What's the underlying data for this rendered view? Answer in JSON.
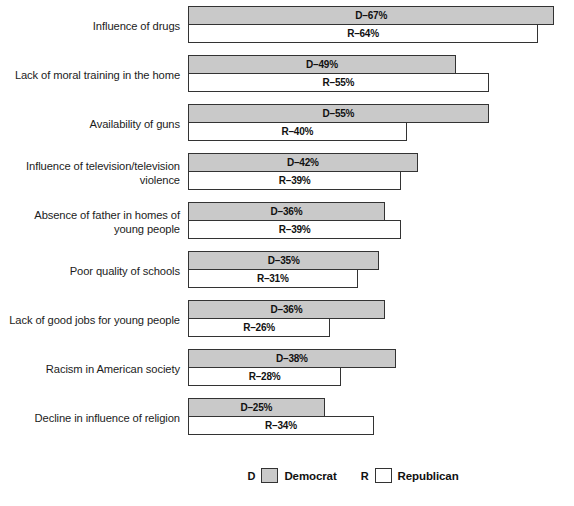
{
  "chart_data": {
    "type": "bar",
    "orientation": "horizontal",
    "title": "",
    "xlabel": "",
    "ylabel": "",
    "xlim": [
      0,
      70
    ],
    "grid": false,
    "legend_position": "bottom-center",
    "value_suffix": "%",
    "categories": [
      "Influence of drugs",
      "Lack of moral training in the home",
      "Availability of guns",
      "Influence of television/television violence",
      "Absence of father in homes of young people",
      "Poor quality of schools",
      "Lack of good jobs for young people",
      "Racism in American society",
      "Decline in influence of religion"
    ],
    "series": [
      {
        "name": "Democrat",
        "key": "D",
        "color": "#c9c9c9",
        "values": [
          67,
          49,
          55,
          42,
          36,
          35,
          36,
          38,
          25
        ]
      },
      {
        "name": "Republican",
        "key": "R",
        "color": "#ffffff",
        "values": [
          64,
          55,
          40,
          39,
          39,
          31,
          26,
          28,
          34
        ]
      }
    ]
  },
  "rows": [
    {
      "label_lines": [
        "Influence of drugs"
      ],
      "dem": {
        "label": "D–67%",
        "value": 67
      },
      "rep": {
        "label": "R–64%",
        "value": 64
      }
    },
    {
      "label_lines": [
        "Lack of moral training in the home"
      ],
      "dem": {
        "label": "D–49%",
        "value": 49
      },
      "rep": {
        "label": "R–55%",
        "value": 55
      }
    },
    {
      "label_lines": [
        "Availability of guns"
      ],
      "dem": {
        "label": "D–55%",
        "value": 55
      },
      "rep": {
        "label": "R–40%",
        "value": 40
      }
    },
    {
      "label_lines": [
        "Influence of television/television",
        "violence"
      ],
      "dem": {
        "label": "D–42%",
        "value": 42
      },
      "rep": {
        "label": "R–39%",
        "value": 39
      }
    },
    {
      "label_lines": [
        "Absence of father in homes of",
        "young people"
      ],
      "dem": {
        "label": "D–36%",
        "value": 36
      },
      "rep": {
        "label": "R–39%",
        "value": 39
      }
    },
    {
      "label_lines": [
        "Poor quality of schools"
      ],
      "dem": {
        "label": "D–35%",
        "value": 35
      },
      "rep": {
        "label": "R–31%",
        "value": 31
      }
    },
    {
      "label_lines": [
        "Lack of good jobs for young people"
      ],
      "dem": {
        "label": "D–36%",
        "value": 36
      },
      "rep": {
        "label": "R–26%",
        "value": 26
      }
    },
    {
      "label_lines": [
        "Racism in American society"
      ],
      "dem": {
        "label": "D–38%",
        "value": 38
      },
      "rep": {
        "label": "R–28%",
        "value": 28
      }
    },
    {
      "label_lines": [
        "Decline in influence of religion"
      ],
      "dem": {
        "label": "D–25%",
        "value": 25
      },
      "rep": {
        "label": "R–34%",
        "value": 34
      }
    }
  ],
  "legend": {
    "democrat": {
      "key": "D",
      "label": "Democrat",
      "color": "#c9c9c9"
    },
    "republican": {
      "key": "R",
      "label": "Republican",
      "color": "#ffffff"
    }
  },
  "scale": {
    "origin_x": 188,
    "px_per_percent": 5.47
  }
}
